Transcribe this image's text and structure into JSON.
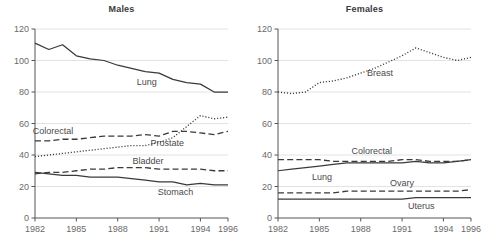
{
  "figure": {
    "width": 486,
    "height": 249,
    "background": "#ffffff",
    "axis_color": "#555555",
    "grid_color": "#e2e2e2",
    "line_color": "#3a3a3a",
    "text_color": "#4a4a4a"
  },
  "panels": [
    {
      "key": "males",
      "title": "Males",
      "plot": {
        "x0": 35,
        "x1": 228,
        "y0": 29,
        "y1": 218
      }
    },
    {
      "key": "females",
      "title": "Females",
      "plot": {
        "x0": 278,
        "x1": 471,
        "y0": 29,
        "y1": 218
      }
    }
  ],
  "chart_data": [
    {
      "type": "line",
      "title": "Males",
      "xlabel": "",
      "ylabel": "",
      "xlim": [
        1982,
        1996
      ],
      "ylim": [
        0,
        120
      ],
      "yticks": [
        0,
        20,
        40,
        60,
        80,
        100,
        120
      ],
      "xticks": [
        1982,
        1985,
        1988,
        1991,
        1994,
        1996
      ],
      "xtick_labels": [
        "1982",
        "1985",
        "1988",
        "1991",
        "1994",
        "1996"
      ],
      "ytick_labels": [
        "0",
        "20",
        "40",
        "60",
        "80",
        "100",
        "120"
      ],
      "grid": "horizontal",
      "legend": "inline-annotations",
      "x": [
        1982,
        1983,
        1984,
        1985,
        1986,
        1987,
        1988,
        1989,
        1990,
        1991,
        1992,
        1993,
        1994,
        1995,
        1996
      ],
      "series": [
        {
          "name": "Lung",
          "style": "solid",
          "label_x": 1990.1,
          "label_y": 86.5,
          "values": [
            111,
            107,
            110,
            103,
            101,
            100,
            97,
            95,
            93,
            92,
            88,
            86,
            85,
            80,
            80
          ]
        },
        {
          "name": "Colorectal",
          "style": "dashed",
          "label_x": 1983.3,
          "label_y": 55.5,
          "values": [
            49,
            49,
            50,
            50,
            51,
            52,
            52,
            52,
            53,
            52,
            55,
            55,
            54,
            53,
            55
          ]
        },
        {
          "name": "Prostate",
          "style": "dotted",
          "label_x": 1991.6,
          "label_y": 47.5,
          "values": [
            39,
            40,
            41,
            42,
            43,
            44,
            45,
            46,
            46,
            48,
            51,
            58,
            65,
            63,
            64
          ]
        },
        {
          "name": "Bladder",
          "style": "dashed",
          "label_x": 1990.2,
          "label_y": 36.5,
          "values": [
            28,
            29,
            29,
            30,
            31,
            31,
            32,
            32,
            32,
            31,
            31,
            31,
            31,
            30,
            30
          ]
        },
        {
          "name": "Stomach",
          "style": "solid",
          "label_x": 1992.2,
          "label_y": 16.5,
          "values": [
            29,
            28,
            27,
            27,
            26,
            26,
            26,
            25,
            24,
            23,
            23,
            21,
            22,
            21,
            21
          ]
        }
      ]
    },
    {
      "type": "line",
      "title": "Females",
      "xlabel": "",
      "ylabel": "",
      "xlim": [
        1982,
        1996
      ],
      "ylim": [
        0,
        120
      ],
      "yticks": [
        0,
        20,
        40,
        60,
        80,
        100,
        120
      ],
      "xticks": [
        1982,
        1985,
        1988,
        1991,
        1994,
        1996
      ],
      "xtick_labels": [
        "1982",
        "1985",
        "1988",
        "1991",
        "1994",
        "1996"
      ],
      "ytick_labels": [
        "0",
        "20",
        "40",
        "60",
        "80",
        "100",
        "120"
      ],
      "grid": "horizontal",
      "legend": "inline-annotations",
      "x": [
        1982,
        1983,
        1984,
        1985,
        1986,
        1987,
        1988,
        1989,
        1990,
        1991,
        1992,
        1993,
        1994,
        1995,
        1996
      ],
      "series": [
        {
          "name": "Breast",
          "style": "dotted",
          "label_x": 1989.4,
          "label_y": 92.0,
          "values": [
            80,
            79,
            80,
            86,
            87,
            89,
            92,
            95,
            99,
            103,
            108,
            105,
            102,
            100,
            102
          ]
        },
        {
          "name": "Colorectal",
          "style": "dashed",
          "label_x": 1988.8,
          "label_y": 42.5,
          "values": [
            37,
            37,
            37,
            37,
            36,
            36,
            36,
            36,
            36,
            37,
            37,
            36,
            36,
            36,
            37
          ]
        },
        {
          "name": "Lung",
          "style": "solid",
          "label_x": 1985.2,
          "label_y": 26.0,
          "values": [
            30,
            31,
            32,
            33,
            34,
            35,
            35,
            35,
            35,
            35,
            36,
            35,
            35,
            36,
            37
          ]
        },
        {
          "name": "Ovary",
          "style": "dashed",
          "label_x": 1991.0,
          "label_y": 22.5,
          "values": [
            16,
            16,
            16,
            16,
            16,
            17,
            17,
            17,
            17,
            17,
            17,
            17,
            17,
            17,
            18
          ]
        },
        {
          "name": "Uterus",
          "style": "solid",
          "label_x": 1992.4,
          "label_y": 7.5,
          "values": [
            12,
            12,
            12,
            12,
            12,
            12,
            12,
            12,
            12,
            12,
            13,
            13,
            13,
            13,
            13
          ]
        }
      ]
    }
  ]
}
